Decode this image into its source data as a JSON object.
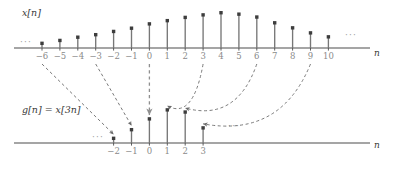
{
  "figure": {
    "title_upper": "x[n]",
    "title_lower": "g[n] = x[3n]",
    "axis_label": "n",
    "ellipsis": "···",
    "colors": {
      "axis": "#4d4d4d",
      "stem": "#777777",
      "marker": "#3d3d3d",
      "tick_text": "#8a8a8a",
      "label_text": "#3a3a3a",
      "arrow": "#6b6b6b",
      "dashed_guide": "#8f8f8f"
    }
  },
  "chart_data": [
    {
      "type": "bar",
      "name": "x[n]",
      "title": "x[n]",
      "xlabel": "n",
      "ylabel": "",
      "grid": false,
      "legend": "none",
      "xlim": [
        -6,
        10
      ],
      "ylim": [
        0,
        1
      ],
      "categories": [
        -6,
        -5,
        -4,
        -3,
        -2,
        -1,
        0,
        1,
        2,
        3,
        4,
        5,
        6,
        7,
        8,
        9,
        10
      ],
      "tick_labels": [
        "−6",
        "−5",
        "−4",
        "−3",
        "−2",
        "−1",
        "0",
        "1",
        "2",
        "3",
        "4",
        "5",
        "6",
        "7",
        "8",
        "9",
        "10"
      ],
      "values": [
        0.13,
        0.21,
        0.3,
        0.37,
        0.46,
        0.55,
        0.67,
        0.76,
        0.85,
        0.92,
        0.98,
        0.94,
        0.86,
        0.7,
        0.56,
        0.42,
        0.31
      ],
      "left_ellipsis": true,
      "right_ellipsis": true,
      "annotations": [
        "···",
        "···"
      ]
    },
    {
      "type": "bar",
      "name": "g[n] = x[3n]",
      "title": "g[n] = x[3n]",
      "xlabel": "n",
      "ylabel": "",
      "grid": false,
      "legend": "none",
      "xlim": [
        -2,
        3
      ],
      "ylim": [
        0,
        1
      ],
      "categories": [
        -2,
        -1,
        0,
        1,
        2,
        3
      ],
      "tick_labels": [
        "−2",
        "−1",
        "0",
        "1",
        "2",
        "3"
      ],
      "values": [
        0.13,
        0.37,
        0.67,
        0.92,
        0.86,
        0.42
      ],
      "left_ellipsis": true,
      "right_ellipsis": true,
      "annotations": [
        "···",
        "···"
      ]
    }
  ],
  "mappings": [
    {
      "from": -6,
      "to": -2
    },
    {
      "from": -3,
      "to": -1
    },
    {
      "from": 0,
      "to": 0
    },
    {
      "from": 3,
      "to": 1
    },
    {
      "from": 6,
      "to": 2
    },
    {
      "from": 9,
      "to": 3
    }
  ],
  "ticks_upper": [
    {
      "value": -6,
      "label": "−6"
    },
    {
      "value": -5,
      "label": "−5"
    },
    {
      "value": -4,
      "label": "−4"
    },
    {
      "value": -3,
      "label": "−3"
    },
    {
      "value": -2,
      "label": "−2"
    },
    {
      "value": -1,
      "label": "−1"
    },
    {
      "value": 0,
      "label": "0"
    },
    {
      "value": 1,
      "label": "1"
    },
    {
      "value": 2,
      "label": "2"
    },
    {
      "value": 3,
      "label": "3"
    },
    {
      "value": 4,
      "label": "4"
    },
    {
      "value": 5,
      "label": "5"
    },
    {
      "value": 6,
      "label": "6"
    },
    {
      "value": 7,
      "label": "7"
    },
    {
      "value": 8,
      "label": "8"
    },
    {
      "value": 9,
      "label": "9"
    },
    {
      "value": 10,
      "label": "10"
    }
  ],
  "ticks_lower": [
    {
      "value": -2,
      "label": "−2"
    },
    {
      "value": -1,
      "label": "−1"
    },
    {
      "value": 0,
      "label": "0"
    },
    {
      "value": 1,
      "label": "1"
    },
    {
      "value": 2,
      "label": "2"
    },
    {
      "value": 3,
      "label": "3"
    }
  ]
}
